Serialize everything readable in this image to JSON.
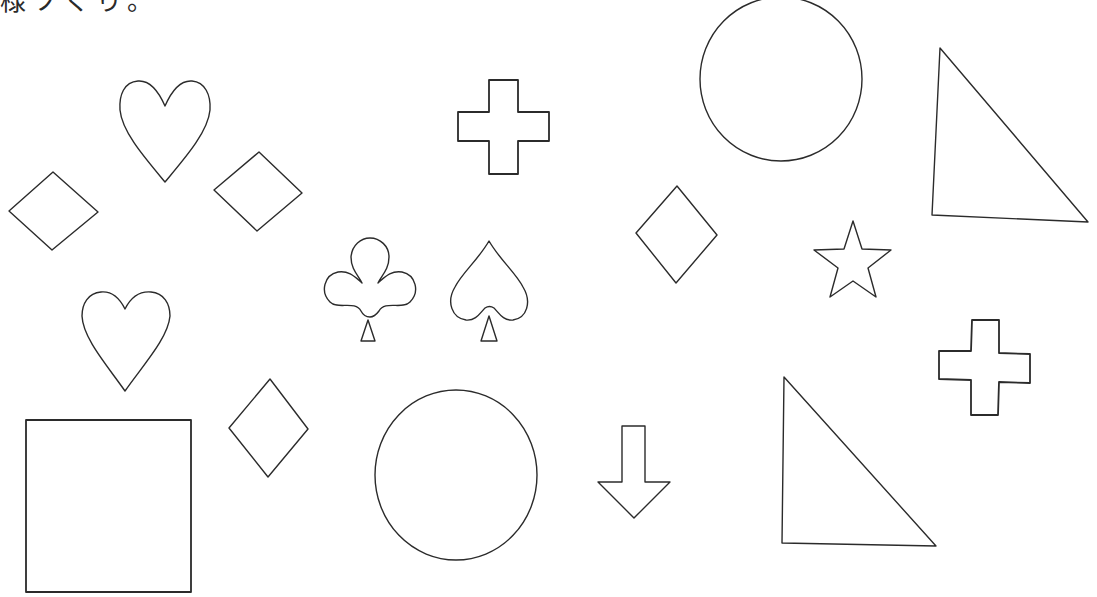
{
  "caption": {
    "text": "様ソぐり。",
    "note_visible": "top line clipped, only lower halves of glyphs visible"
  },
  "colors": {
    "background": "#ffffff",
    "stroke": "#2b2b2b"
  },
  "shapes": [
    {
      "id": "diamond-1",
      "type": "diamond",
      "points": "9,211 53,172 98,212 52,250"
    },
    {
      "id": "heart-1",
      "type": "heart",
      "cx": 165,
      "top": 80,
      "bottom": 182,
      "left": 120,
      "right": 210
    },
    {
      "id": "diamond-2",
      "type": "diamond",
      "points": "214,190 259,152 302,193 257,231"
    },
    {
      "id": "cross-1",
      "type": "cross",
      "x": 458,
      "y": 80,
      "w": 91,
      "h": 94,
      "arm_x": [
        489,
        518
      ],
      "arm_y": [
        112,
        141
      ]
    },
    {
      "id": "circle-1",
      "type": "circle",
      "cx": 781,
      "cy": 79,
      "rx": 81,
      "ry": 82
    },
    {
      "id": "triangle-1",
      "type": "triangle",
      "points": "940,48 932,215 1088,222"
    },
    {
      "id": "diamond-3",
      "type": "diamond",
      "points": "636,233 677,186 717,235 676,283"
    },
    {
      "id": "star-1",
      "type": "star",
      "cx": 853,
      "cy": 262
    },
    {
      "id": "club-1",
      "type": "club",
      "x": 323,
      "y": 238,
      "w": 92,
      "h": 103
    },
    {
      "id": "spade-1",
      "type": "spade",
      "x": 449,
      "y": 241,
      "w": 78,
      "h": 100
    },
    {
      "id": "heart-2",
      "type": "heart",
      "cx": 125,
      "top": 291,
      "bottom": 391,
      "left": 82,
      "right": 170
    },
    {
      "id": "square-1",
      "type": "square",
      "x": 26,
      "y": 420,
      "w": 165,
      "h": 172
    },
    {
      "id": "diamond-4",
      "type": "diamond",
      "points": "229,428 270,379 308,429 268,477"
    },
    {
      "id": "circle-2",
      "type": "circle",
      "cx": 456,
      "cy": 475,
      "rx": 81,
      "ry": 85
    },
    {
      "id": "arrow-down-1",
      "type": "arrow-down",
      "points": "622,426 645,426 645,482 670,482 634,518 598,482 622,482"
    },
    {
      "id": "triangle-2",
      "type": "triangle",
      "points": "784,377 782,543 936,546"
    },
    {
      "id": "cross-2",
      "type": "cross",
      "x": 939,
      "y": 320,
      "w": 91,
      "h": 95,
      "arm_x": [
        972,
        999
      ],
      "arm_y": [
        352,
        382
      ]
    }
  ]
}
